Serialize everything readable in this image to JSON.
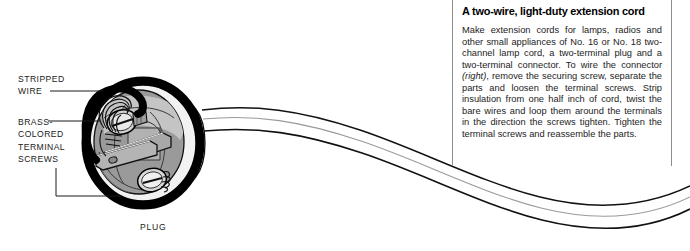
{
  "figure": {
    "callouts": [
      {
        "id": "stripped-wire",
        "text": "STRIPPED\nWIRE"
      },
      {
        "id": "brass-screws",
        "text": "BRASS-\nCOLORED\nTERMINAL\nSCREWS"
      }
    ],
    "caption": "PLUG",
    "colors": {
      "outline": "#000000",
      "body_gray": "#8c8c8c",
      "body_light": "#c9c9c9",
      "highlight": "#ffffff",
      "rule": "#8d8d8d"
    }
  },
  "textbox": {
    "title": "A two-wire, light-duty extension cord",
    "body_pre": "Make extension cords for lamps, radios and other small appliances of No. 16 or No. 18 two-channel lamp cord, a two-terminal plug and a two-terminal connector. To wire the connector ",
    "body_italic": "(right)",
    "body_post": ", remove the securing screw, separate the parts and loosen the terminal screws. Strip insulation from one half inch of cord, twist the bare wires and loop them around the terminals in the direction the screws tighten. Tighten the terminal screws and reassemble the parts."
  }
}
